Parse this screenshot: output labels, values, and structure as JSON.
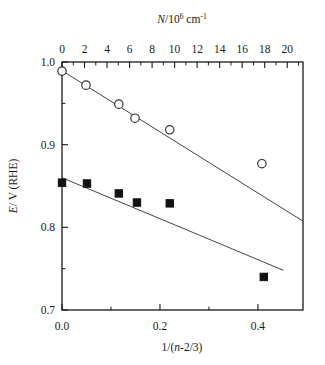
{
  "figure": {
    "background_color": "#ffffff",
    "foreground_color": "#000000",
    "width": 325,
    "height": 365
  },
  "axes": {
    "top": {
      "title_parts": {
        "symbol": "N",
        "divider": "/10",
        "exponent": "6",
        "unit": "cm",
        "unit_exponent": "-1"
      },
      "title_plain": "N/10^6 cm^-1",
      "tick_labels": [
        "0",
        "2",
        "4",
        "6",
        "8",
        "10",
        "12",
        "14",
        "16",
        "18",
        "20"
      ],
      "tick_values": [
        0,
        2,
        4,
        6,
        8,
        10,
        12,
        14,
        16,
        18,
        20
      ],
      "minor_ticks_between": 1,
      "range": [
        0,
        21.4
      ]
    },
    "bottom": {
      "title_parts": {
        "prefix": "1/(",
        "symbol": "n",
        "suffix": "-2/3)"
      },
      "title_plain": "1/(n-2/3)",
      "tick_labels": [
        "0.0",
        "0.2",
        "0.4"
      ],
      "tick_values": [
        0.0,
        0.2,
        0.4
      ],
      "minor_tick_values": [
        0.1,
        0.3,
        0.5
      ],
      "range": [
        0.0,
        0.492
      ]
    },
    "left": {
      "title_parts": {
        "symbol": "E",
        "rest": "/ V (RHE)"
      },
      "title_plain": "E/ V (RHE)",
      "tick_labels": [
        "1.0",
        "0.9",
        "0.8",
        "0.7"
      ],
      "tick_values": [
        1.0,
        0.9,
        0.8,
        0.7
      ],
      "minor_tick_values": [
        0.95,
        0.85,
        0.75
      ],
      "range": [
        0.7,
        1.0
      ]
    }
  },
  "chart_data": {
    "type": "scatter",
    "title": "",
    "xlabel": "1/(n-2/3)",
    "ylabel": "E/ V (RHE)",
    "x2label": "N/10^6 cm^-1",
    "xlim": [
      0.0,
      0.492
    ],
    "ylim": [
      0.7,
      1.0
    ],
    "x2lim": [
      0,
      21.4
    ],
    "grid": false,
    "legend": "none",
    "series": [
      {
        "name": "open-circles",
        "marker": "open-circle",
        "marker_color": "#ffffff",
        "marker_edge_color": "#333333",
        "x": [
          0.0,
          0.049,
          0.116,
          0.149,
          0.22,
          0.408
        ],
        "y": [
          0.989,
          0.972,
          0.949,
          0.932,
          0.918,
          0.877
        ],
        "fit_line": {
          "x": [
            0.0,
            0.492
          ],
          "y": [
            0.9895,
            0.8075
          ]
        }
      },
      {
        "name": "filled-squares",
        "marker": "filled-square",
        "marker_color": "#111111",
        "marker_edge_color": "#111111",
        "x": [
          0.0,
          0.051,
          0.116,
          0.153,
          0.22,
          0.412
        ],
        "y": [
          0.854,
          0.853,
          0.841,
          0.83,
          0.829,
          0.74
        ],
        "fit_line": {
          "x": [
            0.0,
            0.452
          ],
          "y": [
            0.86,
            0.748
          ]
        }
      }
    ]
  }
}
